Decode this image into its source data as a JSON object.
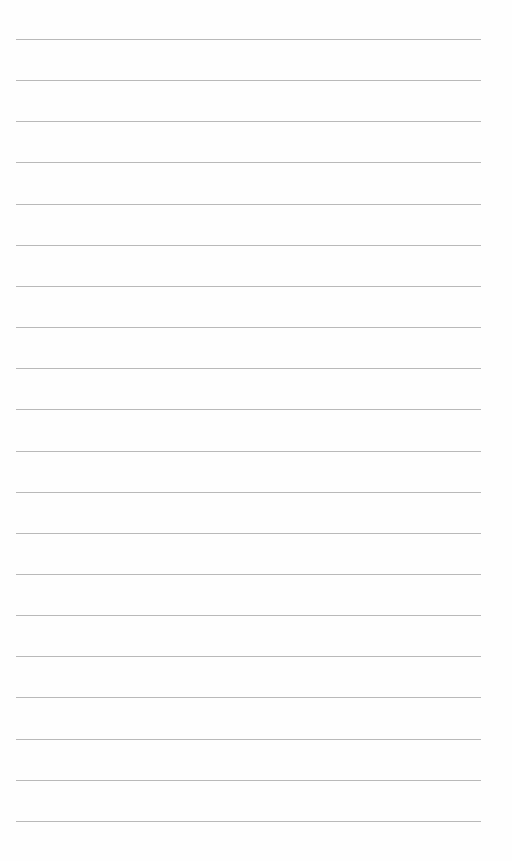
{
  "page": {
    "type": "lined-paper",
    "background": "#fefefe",
    "line_color": "#b9b9b9",
    "line_count": 20,
    "first_line_y": 39,
    "line_spacing": 41.15,
    "line_left": 16,
    "line_width": 465
  }
}
